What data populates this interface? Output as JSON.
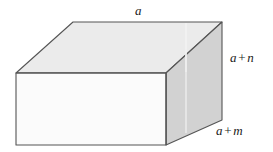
{
  "figure": {
    "name": "rectangular-box-diagram",
    "type": "3d-solid",
    "shape": "rectangular cuboid / box in oblique projection",
    "labels": {
      "top_edge": {
        "text": "a",
        "parts": [
          {
            "kind": "var",
            "text": "a"
          }
        ]
      },
      "right_vertical_edge": {
        "text": "a + n",
        "parts": [
          {
            "kind": "var",
            "text": "a"
          },
          {
            "kind": "op",
            "text": "+"
          },
          {
            "kind": "var",
            "text": "n"
          }
        ]
      },
      "right_depth_edge": {
        "text": "a + m",
        "parts": [
          {
            "kind": "var",
            "text": "a"
          },
          {
            "kind": "op",
            "text": "+"
          },
          {
            "kind": "var",
            "text": "m"
          }
        ]
      }
    },
    "colors": {
      "top_face": "#ebebeb",
      "front_face": "#fbfbfb",
      "right_face": "#d2d2d2",
      "edge_stroke": "#555555",
      "highlight_line": "#f2f2f2",
      "background": "#ffffff",
      "text": "#1a1a1a"
    },
    "geometry": {
      "top_face_points": "73,22 222,22 166,73 16,73",
      "front_face_points": "16,73 166,73 166,145 16,145",
      "right_face_points": "166,73 222,22 222,120 166,145",
      "highlight_line_top": "186,22 186,73",
      "highlight_line_right": "186,50 186,133"
    }
  }
}
